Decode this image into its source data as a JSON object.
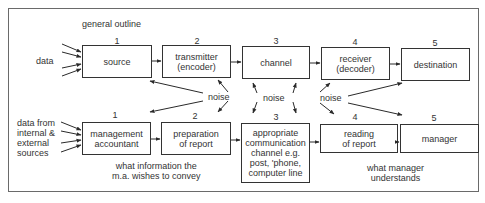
{
  "title": "general outline",
  "top_row": {
    "input_label": "data",
    "boxes": [
      {
        "num": "1",
        "label": "source"
      },
      {
        "num": "2",
        "label": "transmitter\n(encoder)"
      },
      {
        "num": "3",
        "label": "channel"
      },
      {
        "num": "4",
        "label": "receiver\n(decoder)"
      },
      {
        "num": "5",
        "label": "destination"
      }
    ]
  },
  "noise_labels": [
    "noise",
    "noise",
    "noise"
  ],
  "bottom_row": {
    "input_label": "data from\ninternal &\nexternal\nsources",
    "boxes": [
      {
        "num": "1",
        "label": "management\naccountant"
      },
      {
        "num": "2",
        "label": "preparation\nof report"
      },
      {
        "num": "3",
        "label": "appropriate\ncommunication\nchannel e.g.\npost, 'phone,\ncomputer line"
      },
      {
        "num": "4",
        "label": "reading\nof report"
      },
      {
        "num": "5",
        "label": "manager"
      }
    ],
    "annotations": [
      "what information the\nm.a. wishes to convey",
      "what manager\nunderstands"
    ]
  }
}
